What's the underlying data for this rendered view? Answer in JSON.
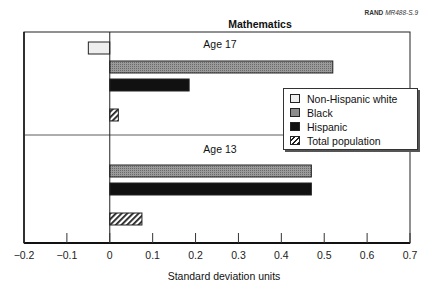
{
  "source": {
    "org": "RAND",
    "id": "MR488-S.9"
  },
  "chart_data": {
    "type": "bar",
    "orientation": "horizontal",
    "title": "Mathematics",
    "xlabel": "Standard deviation units",
    "ylabel": "",
    "xlim": [
      -0.2,
      0.7
    ],
    "xticks": [
      -0.2,
      -0.1,
      0,
      0.1,
      0.2,
      0.3,
      0.4,
      0.5,
      0.6,
      0.7
    ],
    "xtick_labels": [
      "−0.2",
      "−0.1",
      "0",
      "0.1",
      "0.2",
      "0.3",
      "0.4",
      "0.5",
      "0.6",
      "0.7"
    ],
    "categories": [
      "Age 17",
      "Age 13"
    ],
    "series": [
      {
        "name": "Non-Hispanic white",
        "values": [
          -0.05,
          0.0
        ],
        "color": "#e8e8e8"
      },
      {
        "name": "Black",
        "values": [
          0.52,
          0.47
        ],
        "color": "#8c8c8c"
      },
      {
        "name": "Hispanic",
        "values": [
          0.185,
          0.47
        ],
        "color": "#111111"
      },
      {
        "name": "Total population",
        "values": [
          0.02,
          0.075
        ],
        "color": "hatched"
      }
    ],
    "legend_position": "right-middle",
    "grid": false
  },
  "legend": {
    "items": [
      {
        "label": "Non-Hispanic white"
      },
      {
        "label": "Black"
      },
      {
        "label": "Hispanic"
      },
      {
        "label": "Total population"
      }
    ]
  },
  "groups": {
    "top": "Age 17",
    "bottom": "Age 13"
  }
}
